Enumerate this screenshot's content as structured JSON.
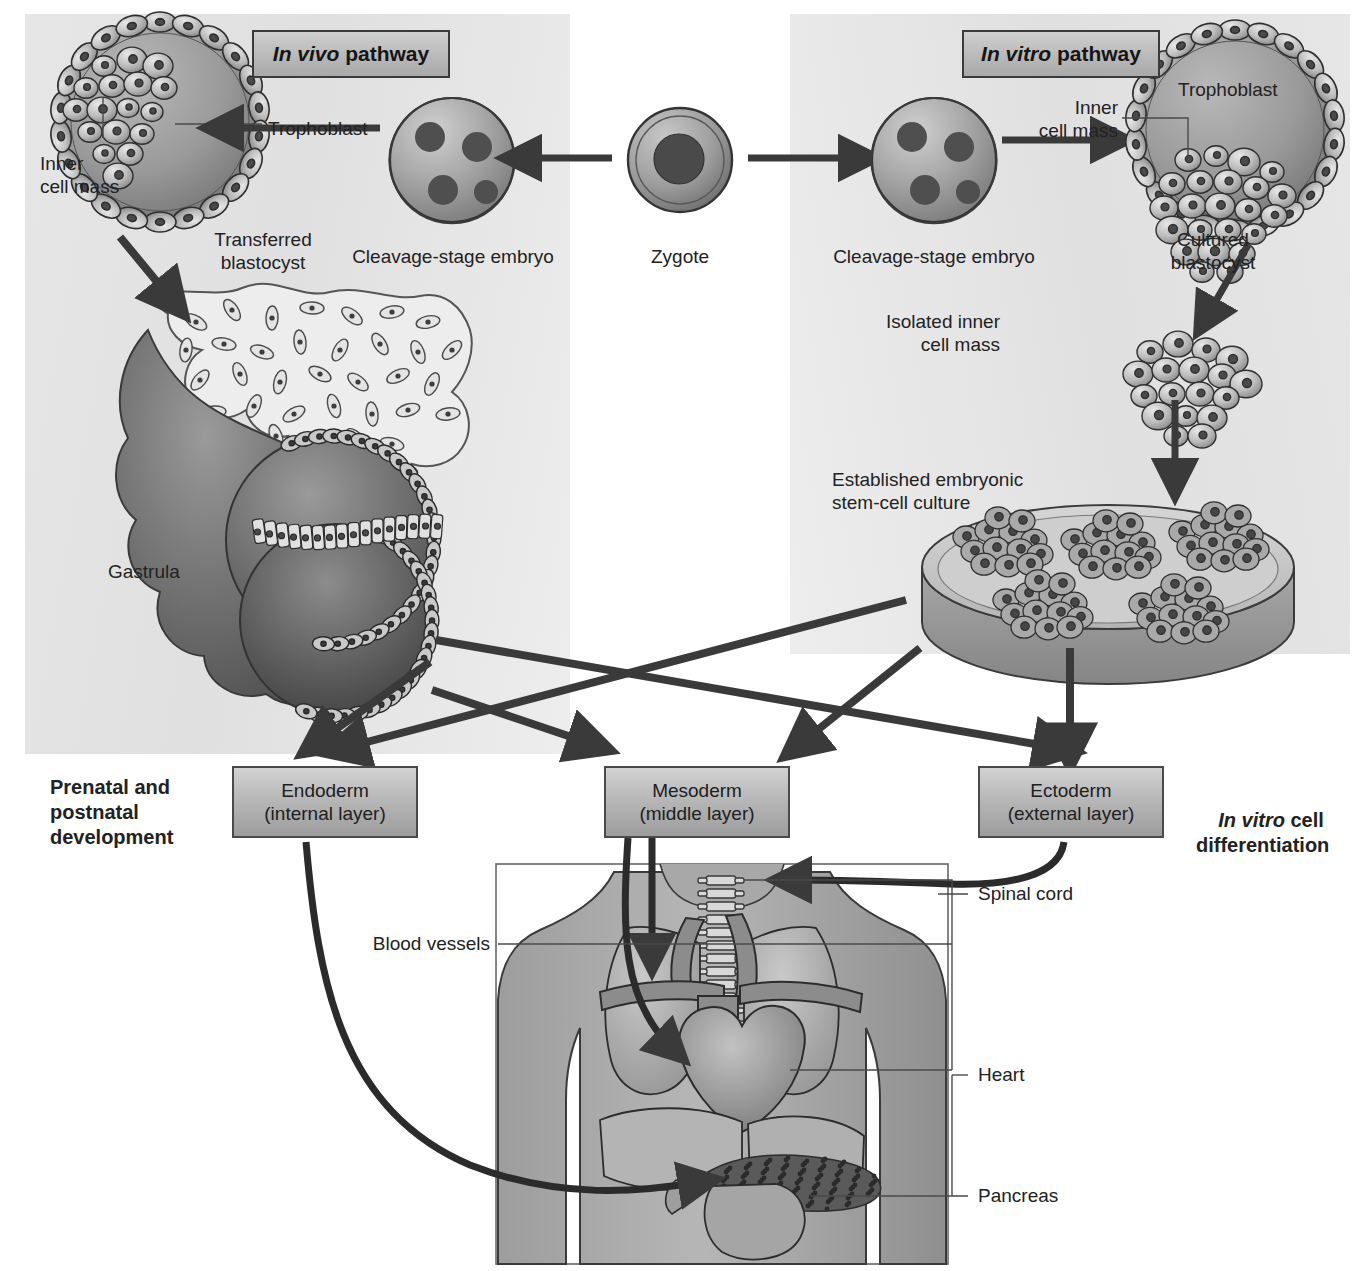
{
  "figure": {
    "type": "biology-process-diagram",
    "background": "#ffffff",
    "panel_fill": "#e2e2e2",
    "ink": "#303030"
  },
  "headers": {
    "left": {
      "italic": "In vivo",
      "rest": " pathway"
    },
    "right": {
      "italic": "In vitro",
      "rest": " pathway"
    }
  },
  "side_labels": {
    "left": "Prenatal and\npostnatal\ndevelopment",
    "right_italic": "In vitro",
    "right_rest": " cell\ndifferentiation"
  },
  "invivo": {
    "blastocyst": {
      "callout_trophoblast": "Trophoblast",
      "callout_icm": "Inner\ncell mass",
      "caption": "Transferred\nblastocyst"
    },
    "cleavage_caption": "Cleavage-stage embryo",
    "gastrula_label": "Gastrula"
  },
  "center": {
    "zygote_caption": "Zygote"
  },
  "invitro": {
    "cleavage_caption": "Cleavage-stage embryo",
    "blastocyst": {
      "callout_trophoblast": "Trophoblast",
      "callout_icm": "Inner\ncell mass",
      "caption": "Cultured\nblastocyst"
    },
    "isolated_icm_label": "Isolated inner\ncell mass",
    "culture_label": "Established embryonic\nstem-cell culture",
    "colony_count": 5
  },
  "germ_layers": [
    {
      "name": "Endoderm",
      "sub": "(internal layer)"
    },
    {
      "name": "Mesoderm",
      "sub": "(middle layer)"
    },
    {
      "name": "Ectoderm",
      "sub": "(external layer)"
    }
  ],
  "anatomy": {
    "labels": [
      {
        "text": "Spinal cord",
        "organ": "spinal-cord"
      },
      {
        "text": "Blood vessels",
        "organ": "blood-vessels"
      },
      {
        "text": "Heart",
        "organ": "heart"
      },
      {
        "text": "Pancreas",
        "organ": "pancreas"
      }
    ]
  },
  "icons": {
    "arrow": "arrow-icon",
    "zygote": "zygote-icon",
    "embryo": "cleavage-embryo-icon",
    "blastocyst": "blastocyst-icon",
    "gastrula": "gastrula-icon",
    "petri": "petri-dish-icon",
    "torso": "human-torso-icon"
  }
}
